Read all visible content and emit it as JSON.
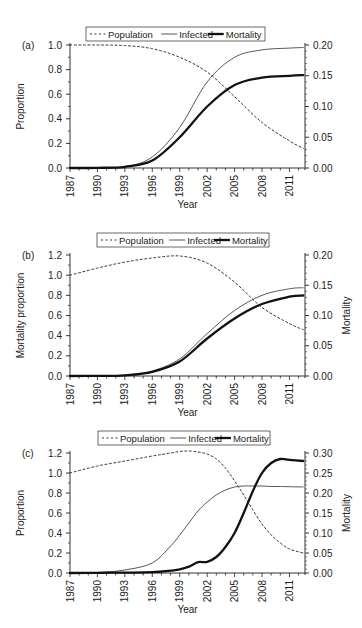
{
  "chart_data": [
    {
      "panel": "(a)",
      "type": "line",
      "title": "",
      "xlabel": "Year",
      "ylabel": "Proportion",
      "ylabel_right": "",
      "ylim": [
        0,
        1.0
      ],
      "ylim_right": [
        0,
        0.2
      ],
      "yticks": [
        "0.0",
        "0.2",
        "0.4",
        "0.6",
        "0.8",
        "1.0"
      ],
      "yticks_right": [
        "0.00",
        "0.05",
        "0.10",
        "0.15",
        "0.20"
      ],
      "xticks": [
        "1987",
        "1990",
        "1993",
        "1996",
        "1999",
        "2002",
        "2005",
        "2008",
        "2011"
      ],
      "legend": [
        "Population",
        "Infected",
        "Mortality"
      ],
      "legend_position": "top",
      "x": [
        1987,
        1990,
        1993,
        1996,
        1999,
        2002,
        2005,
        2008,
        2011,
        2012.5
      ],
      "series": [
        {
          "name": "Population",
          "axis": "left",
          "style": "dotted",
          "values": [
            1.0,
            1.0,
            0.995,
            0.97,
            0.9,
            0.78,
            0.58,
            0.37,
            0.22,
            0.16
          ]
        },
        {
          "name": "Infected",
          "axis": "left",
          "style": "thin",
          "values": [
            0.0,
            0.002,
            0.01,
            0.09,
            0.33,
            0.7,
            0.9,
            0.96,
            0.975,
            0.98
          ]
        },
        {
          "name": "Mortality",
          "axis": "right",
          "style": "thick",
          "values": [
            0.0,
            0.0003,
            0.002,
            0.012,
            0.05,
            0.1,
            0.135,
            0.147,
            0.15,
            0.151
          ]
        }
      ]
    },
    {
      "panel": "(b)",
      "type": "line",
      "title": "",
      "xlabel": "Year",
      "ylabel": "Mortality proportion",
      "ylabel_right": "Mortality",
      "ylim": [
        0,
        1.2
      ],
      "ylim_right": [
        0,
        0.2
      ],
      "yticks": [
        "0.0",
        "0.2",
        "0.4",
        "0.6",
        "0.8",
        "1.0",
        "1.2"
      ],
      "yticks_right": [
        "0.00",
        "0.05",
        "0.10",
        "0.15",
        "0.20"
      ],
      "xticks": [
        "1987",
        "1990",
        "1993",
        "1996",
        "1999",
        "2002",
        "2005",
        "2008",
        "2011"
      ],
      "legend": [
        "Population",
        "Infected",
        "Mortality"
      ],
      "legend_position": "top",
      "x": [
        1987,
        1990,
        1993,
        1996,
        1999,
        2002,
        2005,
        2008,
        2011,
        2012.5
      ],
      "series": [
        {
          "name": "Population",
          "axis": "left",
          "style": "dotted",
          "values": [
            1.0,
            1.07,
            1.13,
            1.17,
            1.19,
            1.12,
            0.93,
            0.68,
            0.52,
            0.46
          ]
        },
        {
          "name": "Infected",
          "axis": "left",
          "style": "thin",
          "values": [
            0.0,
            0.001,
            0.008,
            0.05,
            0.17,
            0.42,
            0.65,
            0.8,
            0.865,
            0.875
          ]
        },
        {
          "name": "Mortality",
          "axis": "right",
          "style": "thick",
          "values": [
            0.0,
            0.0002,
            0.0012,
            0.007,
            0.024,
            0.062,
            0.095,
            0.119,
            0.131,
            0.133
          ]
        }
      ]
    },
    {
      "panel": "(c)",
      "type": "line",
      "title": "",
      "xlabel": "Year",
      "ylabel": "Proportion",
      "ylabel_right": "Mortality",
      "ylim": [
        0,
        1.2
      ],
      "ylim_right": [
        0,
        0.3
      ],
      "yticks": [
        "0.0",
        "0.2",
        "0.4",
        "0.6",
        "0.8",
        "1.0",
        "1.2"
      ],
      "yticks_right": [
        "0.00",
        "0.05",
        "0.10",
        "0.15",
        "0.20",
        "0.25",
        "0.30"
      ],
      "xticks": [
        "1987",
        "1990",
        "1993",
        "1996",
        "1999",
        "2002",
        "2005",
        "2008",
        "2011"
      ],
      "legend": [
        "Population",
        "Infected",
        "Mortality"
      ],
      "legend_position": "top",
      "x": [
        1987,
        1990,
        1993,
        1996,
        1998,
        1999,
        2000,
        2001,
        2002,
        2003,
        2004,
        2005,
        2006,
        2007,
        2008,
        2009,
        2010,
        2011,
        2012.5
      ],
      "series": [
        {
          "name": "Population",
          "axis": "left",
          "style": "dotted",
          "values": [
            1.0,
            1.07,
            1.12,
            1.17,
            1.2,
            1.215,
            1.22,
            1.21,
            1.19,
            1.14,
            1.05,
            0.92,
            0.78,
            0.63,
            0.49,
            0.38,
            0.3,
            0.24,
            0.2
          ]
        },
        {
          "name": "Infected",
          "axis": "left",
          "style": "thin",
          "values": [
            0.0,
            0.005,
            0.03,
            0.1,
            0.27,
            0.38,
            0.5,
            0.62,
            0.71,
            0.78,
            0.83,
            0.86,
            0.87,
            0.87,
            0.87,
            0.865,
            0.865,
            0.863,
            0.86
          ]
        },
        {
          "name": "Mortality",
          "axis": "right",
          "style": "thick",
          "values": [
            0.0,
            0.0005,
            0.001,
            0.002,
            0.006,
            0.009,
            0.016,
            0.027,
            0.028,
            0.04,
            0.065,
            0.1,
            0.15,
            0.205,
            0.25,
            0.275,
            0.285,
            0.283,
            0.28
          ]
        }
      ]
    }
  ]
}
